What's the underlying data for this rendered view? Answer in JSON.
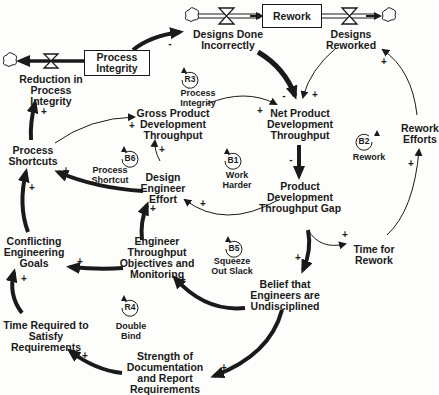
{
  "diagram": {
    "type": "causal-loop / stock-and-flow",
    "stocks": [
      {
        "id": "process_integrity",
        "label": "Process\nIntegrity"
      },
      {
        "id": "rework",
        "label": "Rework"
      }
    ],
    "flows": [
      {
        "id": "reduction_in_process_integrity",
        "label": "Reduction in\nProcess\nIntegrity"
      },
      {
        "id": "designs_done_incorrectly",
        "label": "Designs Done\nIncorrectly"
      },
      {
        "id": "designs_reworked",
        "label": "Designs\nReworked"
      }
    ],
    "variables": [
      {
        "id": "gross_pdt",
        "label": "Gross Product\nDevelopment\nThroughput"
      },
      {
        "id": "net_pdt",
        "label": "Net Product\nDevelopment\nThroughput"
      },
      {
        "id": "process_shortcuts",
        "label": "Process\nShortcuts"
      },
      {
        "id": "rework_efforts",
        "label": "Rework\nEfforts"
      },
      {
        "id": "design_engineer_effort",
        "label": "Design\nEngineer\nEffort"
      },
      {
        "id": "pdt_gap",
        "label": "Product\nDevelopment\nThroughput Gap"
      },
      {
        "id": "conflicting_goals",
        "label": "Conflicting\nEngineering\nGoals"
      },
      {
        "id": "engineer_objectives",
        "label": "Engineer\nThroughput\nObjectives and\nMonitoring"
      },
      {
        "id": "time_for_rework",
        "label": "Time for\nRework"
      },
      {
        "id": "belief_undisciplined",
        "label": "Belief that\nEngineers are\nUndisciplined"
      },
      {
        "id": "time_required",
        "label": "Time Required to\nSatisfy\nRequirements"
      },
      {
        "id": "strength_documentation",
        "label": "Strength of\nDocumentation\nand Report\nRequirements"
      }
    ],
    "loops": [
      {
        "id": "R3",
        "name": "Process\nIntegrity"
      },
      {
        "id": "B6",
        "name": "Process\nShortcut"
      },
      {
        "id": "B1",
        "name": "Work\nHarder"
      },
      {
        "id": "B2",
        "name": "Rework"
      },
      {
        "id": "B5",
        "name": "Squeeze\nOut Slack"
      },
      {
        "id": "R4",
        "name": "Double\nBind"
      }
    ],
    "signs": {
      "plus": "+",
      "minus": "-"
    },
    "colors": {
      "ink": "#1a1a1a",
      "background": "#fdfdfb"
    }
  }
}
